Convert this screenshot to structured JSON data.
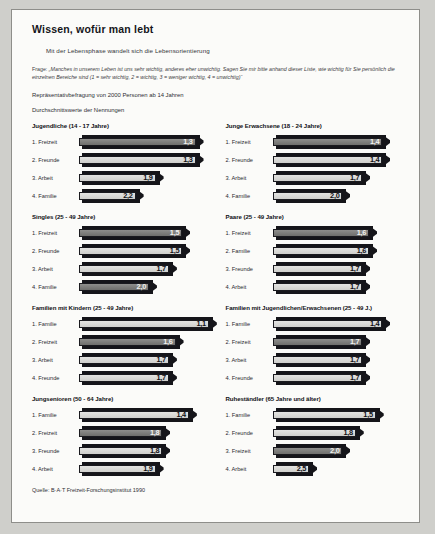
{
  "page": {
    "title": "Wissen, wofür man lebt",
    "subtitle": "Mit der Lebensphase wandelt sich die Lebensorientierung",
    "question_lead": "Frage:",
    "question_text": "„Manches in unserem Leben ist uns sehr wichtig, anderes eher unwichtig. Sagen Sie mir bitte anhand dieser Liste, wie wichtig für Sie persönlich die einzelnen Bereiche sind (1 = sehr wichtig, 2 = wichtig, 3 = weniger wichtig, 4 = unwichtig)“",
    "sample_note": "Repräsentativbefragung von 2000 Personen ab 14 Jahren",
    "values_note": "Durchschnittswerte der Nennungen",
    "source": "Quelle:  B·A·T Freizeit-Forschungsinstitut 1990"
  },
  "chart_data": {
    "type": "bar",
    "title": "Wissen, wofür man lebt",
    "subtitle": "Mit der Lebensphase wandelt sich die Lebensorientierung",
    "xlabel": "Durchschnittswerte der Nennungen",
    "ylabel": "",
    "scale_note": "1 = sehr wichtig, 2 = wichtig, 3 = weniger wichtig, 4 = unwichtig",
    "xlim": [
      1.0,
      2.6
    ],
    "grid": false,
    "legend": "none",
    "note": "Bar length is inverse to the value: the lower (more important) the average score, the longer the bar.",
    "groups": [
      {
        "name": "Jugendliche (14 - 17 Jahre)",
        "categories": [
          "1. Freizeit",
          "2. Freunde",
          "3. Arbeit",
          "4. Familie"
        ],
        "values": [
          1.3,
          1.3,
          1.9,
          2.2
        ],
        "labels": [
          "1,3",
          "1,3",
          "1,9",
          "2,2"
        ],
        "shades": [
          "dark",
          "light",
          "light",
          "light"
        ]
      },
      {
        "name": "Junge Erwachsene (18 - 24 Jahre)",
        "categories": [
          "1. Freizeit",
          "2. Freunde",
          "3. Arbeit",
          "4. Familie"
        ],
        "values": [
          1.4,
          1.4,
          1.7,
          2.0
        ],
        "labels": [
          "1,4",
          "1,4",
          "1,7",
          "2,0"
        ],
        "shades": [
          "dark",
          "light",
          "light",
          "light"
        ]
      },
      {
        "name": "Singles (25 - 49 Jahre)",
        "categories": [
          "1. Freizeit",
          "2. Freunde",
          "3. Arbeit",
          "4. Familie"
        ],
        "values": [
          1.5,
          1.5,
          1.7,
          2.0
        ],
        "labels": [
          "1,5",
          "1,5",
          "1,7",
          "2,0"
        ],
        "shades": [
          "dark",
          "light",
          "light",
          "dark"
        ]
      },
      {
        "name": "Paare (25 - 49 Jahre)",
        "categories": [
          "1. Freizeit",
          "2. Familie",
          "3. Freunde",
          "4. Arbeit"
        ],
        "values": [
          1.6,
          1.6,
          1.7,
          1.7
        ],
        "labels": [
          "1,6",
          "1,6",
          "1,7",
          "1,7"
        ],
        "shades": [
          "dark",
          "light",
          "light",
          "light"
        ]
      },
      {
        "name": "Familien mit Kindern (25 - 49 Jahre)",
        "categories": [
          "1. Familie",
          "2. Freizeit",
          "3. Arbeit",
          "4. Freunde"
        ],
        "values": [
          1.1,
          1.6,
          1.7,
          1.7
        ],
        "labels": [
          "1,1",
          "1,6",
          "1,7",
          "1,7"
        ],
        "shades": [
          "light",
          "dark",
          "light",
          "light"
        ]
      },
      {
        "name": "Familien mit Jugendlichen/Erwachsenen (25 - 49 J.)",
        "categories": [
          "1. Familie",
          "2. Freizeit",
          "3. Arbeit",
          "4. Freunde"
        ],
        "values": [
          1.4,
          1.7,
          1.7,
          1.7
        ],
        "labels": [
          "1,4",
          "1,7",
          "1,7",
          "1,7"
        ],
        "shades": [
          "light",
          "dark",
          "light",
          "light"
        ]
      },
      {
        "name": "Jungsenioren (50 - 64 Jahre)",
        "categories": [
          "1. Familie",
          "2. Freizeit",
          "3. Freunde",
          "4. Arbeit"
        ],
        "values": [
          1.4,
          1.8,
          1.8,
          1.9
        ],
        "labels": [
          "1,4",
          "1,8",
          "1,8",
          "1,9"
        ],
        "shades": [
          "light",
          "dark",
          "light",
          "light"
        ]
      },
      {
        "name": "Ruheständler (65 Jahre und älter)",
        "categories": [
          "1. Familie",
          "2. Freunde",
          "3. Freizeit",
          "4. Arbeit"
        ],
        "values": [
          1.5,
          1.8,
          2.0,
          2.5
        ],
        "labels": [
          "1,5",
          "1,8",
          "2,0",
          "2,5"
        ],
        "shades": [
          "light",
          "light",
          "dark",
          "light"
        ]
      }
    ]
  }
}
